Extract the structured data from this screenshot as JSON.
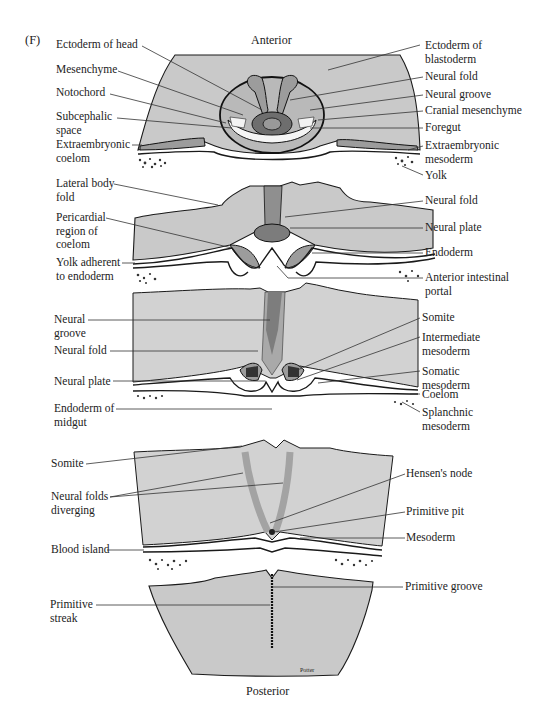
{
  "figure": {
    "panel_letter": "(F)",
    "orientation_top": "Anterior",
    "orientation_bottom": "Posterior",
    "signature": "Potter",
    "colors": {
      "tissue": "#c9c9c9",
      "dark_tissue": "#9c9c9c",
      "outline": "#1a1a1a",
      "background": "#ffffff"
    }
  },
  "sections": [
    {
      "name": "head-region",
      "left_labels": [
        "Ectoderm of head",
        "Mesenchyme",
        "Notochord",
        "Subcephalic\nspace",
        "Extraembryonic\ncoelom"
      ],
      "right_labels": [
        "Ectoderm of\nblastoderm",
        "Neural fold",
        "Neural groove",
        "Cranial mesenchyme",
        "Foregut",
        "Extraembryonic\nmesoderm",
        "Yolk"
      ]
    },
    {
      "name": "anterior-intestinal-portal-region",
      "left_labels": [
        "Lateral body\nfold",
        "Pericardial\nregion of\ncoelom",
        "Yolk adherent\nto endoderm"
      ],
      "right_labels": [
        "Neural fold",
        "Neural plate",
        "Endoderm",
        "Anterior intestinal\nportal"
      ]
    },
    {
      "name": "midgut-region",
      "left_labels": [
        "Neural\ngroove",
        "Neural fold",
        "Neural plate",
        "Endoderm of\nmidgut"
      ],
      "right_labels": [
        "Somite",
        "Intermediate\nmesoderm",
        "Somatic\nmesoderm",
        "Coelom",
        "Splanchnic\nmesoderm"
      ]
    },
    {
      "name": "hensens-node-region",
      "left_labels": [
        "Somite",
        "Neural folds\ndiverging",
        "Blood island"
      ],
      "right_labels": [
        "Hensen's node",
        "Primitive pit",
        "Mesoderm"
      ]
    },
    {
      "name": "primitive-streak-region",
      "left_labels": [
        "Primitive\nstreak"
      ],
      "right_labels": [
        "Primitive groove"
      ]
    }
  ]
}
